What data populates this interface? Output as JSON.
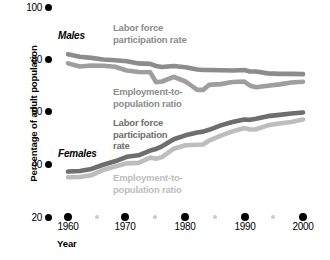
{
  "chart_data": {
    "type": "line",
    "title": "",
    "xlabel": "Year",
    "ylabel": "Percentage of adult population",
    "xlim": [
      1958,
      2001
    ],
    "ylim": [
      20,
      100
    ],
    "x_ticks": [
      "1960",
      "1970",
      "1980",
      "1990",
      "2000"
    ],
    "x_tick_values": [
      1960,
      1970,
      1980,
      1990,
      2000
    ],
    "x_minor_values": [
      1965,
      1975,
      1985,
      1995
    ],
    "y_ticks": [
      "20",
      "40",
      "60",
      "80",
      "100"
    ],
    "y_tick_values": [
      20,
      40,
      60,
      80,
      100
    ],
    "grid": false,
    "legend_position": "inline-annotations",
    "colors": {
      "males_lfp": "#8c8c8c",
      "males_epr": "#9e9e9e",
      "females_lfp": "#6e6e6e",
      "females_epr": "#bdbdbd",
      "axis": "#000000",
      "minor_tick": "#c9c9c9",
      "background": "#ffffff"
    },
    "annotations": {
      "males_group": "Males",
      "females_group": "Females",
      "males_lfp_label": "Labor force\nparticipation rate",
      "males_lfp_label_line1": "Labor force",
      "males_lfp_label_line2": "participation rate",
      "males_epr_label_line1": "Employment-to-",
      "males_epr_label_line2": "population ratio",
      "females_lfp_label_line1": "Labor force",
      "females_lfp_label_line2": "participation",
      "females_lfp_label_line3": "rate",
      "females_epr_label_line1": "Employment-to-",
      "females_epr_label_line2": "population ratio"
    },
    "x": [
      1960,
      1962,
      1964,
      1966,
      1968,
      1970,
      1972,
      1974,
      1975,
      1976,
      1978,
      1980,
      1982,
      1983,
      1984,
      1986,
      1988,
      1990,
      1991,
      1992,
      1994,
      1996,
      1998,
      2000
    ],
    "series": [
      {
        "name": "Males - Labor force participation rate",
        "group": "Males",
        "color": "#8c8c8c",
        "values": [
          82.4,
          81.4,
          81.0,
          80.4,
          80.1,
          79.7,
          78.9,
          78.7,
          77.9,
          77.5,
          77.9,
          77.4,
          76.6,
          76.4,
          76.4,
          76.3,
          76.2,
          76.4,
          75.8,
          75.8,
          75.1,
          74.9,
          74.9,
          74.8
        ],
        "units": "percent"
      },
      {
        "name": "Males - Employment-to-population ratio",
        "group": "Males",
        "color": "#9e9e9e",
        "values": [
          78.9,
          77.7,
          78.1,
          78.0,
          77.6,
          76.2,
          75.6,
          75.5,
          71.7,
          72.0,
          73.8,
          72.0,
          68.8,
          68.8,
          70.7,
          71.0,
          71.8,
          72.0,
          70.4,
          69.8,
          70.4,
          70.9,
          71.6,
          71.9
        ],
        "units": "percent"
      },
      {
        "name": "Females - Labor force participation rate",
        "group": "Females",
        "color": "#6e6e6e",
        "values": [
          37.7,
          37.9,
          38.7,
          40.3,
          41.6,
          43.3,
          43.9,
          45.7,
          46.3,
          47.3,
          50.0,
          51.5,
          52.6,
          52.9,
          53.6,
          55.3,
          56.6,
          57.5,
          57.4,
          57.8,
          58.8,
          59.3,
          59.8,
          60.2
        ],
        "units": "percent"
      },
      {
        "name": "Females - Employment-to-population ratio",
        "group": "Females",
        "color": "#bdbdbd",
        "values": [
          35.5,
          35.6,
          36.3,
          38.3,
          39.6,
          40.8,
          41.0,
          43.0,
          42.6,
          43.2,
          46.4,
          47.7,
          47.9,
          48.0,
          49.5,
          51.4,
          53.0,
          54.3,
          53.7,
          53.8,
          55.3,
          56.0,
          56.6,
          57.5
        ],
        "units": "percent"
      }
    ]
  },
  "axes": {
    "y_title": "Percentage of adult population",
    "x_title": "Year"
  }
}
